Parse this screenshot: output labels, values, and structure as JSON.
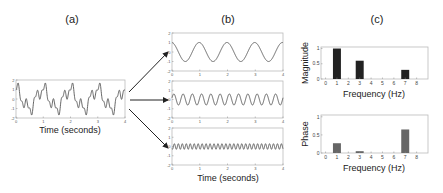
{
  "labels": {
    "a": "(a)",
    "b": "(b)",
    "c": "(c)"
  },
  "chart_data": [
    {
      "id": "a",
      "type": "line",
      "title": "(a)",
      "xlabel": "Time (seconds)",
      "ylabel": "",
      "xlim": [
        0,
        4
      ],
      "ylim": [
        -2,
        2
      ],
      "xticks": [
        0,
        1,
        2,
        3,
        4
      ],
      "yticks": [
        -2,
        -1,
        0,
        1,
        2
      ],
      "description": "Composite signal: sum of 1 Hz, 3 Hz and 7 Hz sinusoids",
      "components": [
        {
          "freq_hz": 1,
          "amplitude": 1.0,
          "phase": 0.27
        },
        {
          "freq_hz": 3,
          "amplitude": 0.6,
          "phase": 0.05
        },
        {
          "freq_hz": 7,
          "amplitude": 0.3,
          "phase": 0.65
        }
      ]
    },
    {
      "id": "b",
      "type": "line",
      "title": "(b)",
      "xlabel": "Time (seconds)",
      "xlim": [
        0,
        4
      ],
      "ylim": [
        -2,
        2
      ],
      "xticks": [
        0,
        1,
        2,
        3,
        4
      ],
      "yticks": [
        -2,
        -1,
        0,
        1,
        2
      ],
      "series": [
        {
          "name": "1 Hz component",
          "freq_hz": 1,
          "amplitude": 1.0,
          "phase": 0.27
        },
        {
          "name": "3 Hz component",
          "freq_hz": 3,
          "amplitude": 0.6,
          "phase": 0.05
        },
        {
          "name": "7 Hz component",
          "freq_hz": 7,
          "amplitude": 0.3,
          "phase": 0.65
        }
      ]
    },
    {
      "id": "c-magnitude",
      "type": "bar",
      "title": "(c)",
      "xlabel": "Frequency (Hz)",
      "ylabel": "Magnitude",
      "categories": [
        0,
        1,
        2,
        3,
        4,
        5,
        6,
        7,
        8
      ],
      "values": [
        0,
        1.0,
        0,
        0.6,
        0,
        0,
        0,
        0.3,
        0
      ],
      "ylim": [
        0,
        1.05
      ],
      "yticks": [
        0,
        0.5,
        1
      ],
      "bar_color": "#222222"
    },
    {
      "id": "c-phase",
      "type": "bar",
      "xlabel": "Frequency (Hz)",
      "ylabel": "Phase",
      "categories": [
        0,
        1,
        2,
        3,
        4,
        5,
        6,
        7,
        8
      ],
      "values": [
        0,
        0.27,
        0,
        0.05,
        0,
        0,
        0,
        0.65,
        0
      ],
      "ylim": [
        0,
        1.05
      ],
      "yticks": [
        0,
        0.5,
        1
      ],
      "bar_color": "#666666"
    }
  ]
}
